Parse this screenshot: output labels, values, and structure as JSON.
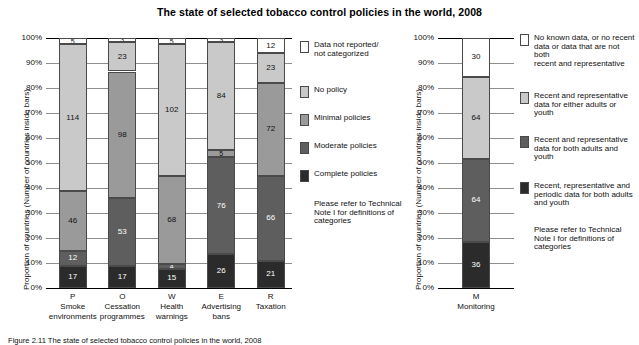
{
  "title": "The state of selected tobacco control policies in the world, 2008",
  "caption": "Figure 2.11 The state of selected tobacco control policies in the world, 2008",
  "colors": {
    "not_reported": "#ffffff",
    "no_policy": "#c9c9c9",
    "minimal": "#9a9a9a",
    "moderate": "#5e5e5e",
    "complete": "#2b2b2b",
    "gridline": "#8e8e8e",
    "axis": "#000000",
    "text": "#111111"
  },
  "left_panel": {
    "y_axis_label": "Proportion of countries (Number of countries inside bars)",
    "tick_labels": [
      "100%",
      "90%",
      "80%",
      "70%",
      "60%",
      "50%",
      "40%",
      "30%",
      "20%",
      "10%",
      "0%"
    ],
    "categories": [
      {
        "letter": "P",
        "name": "Smoke\nenvironments"
      },
      {
        "letter": "O",
        "name": "Cessation\nprogrammes"
      },
      {
        "letter": "W",
        "name": "Health\nwarnings"
      },
      {
        "letter": "E",
        "name": "Advertising\nbans"
      },
      {
        "letter": "R",
        "name": "Taxation"
      }
    ],
    "legend": {
      "items": [
        {
          "key": "not_reported",
          "label": "Data not reported/\nnot categorized"
        },
        {
          "key": "no_policy",
          "label": "No policy"
        },
        {
          "key": "minimal",
          "label": "Minimal policies"
        },
        {
          "key": "moderate",
          "label": "Moderate policies"
        },
        {
          "key": "complete",
          "label": "Complete policies"
        }
      ],
      "note": "Please refer to Technical\nNote I for definitions of\ncategories"
    }
  },
  "right_panel": {
    "y_axis_label": "Proportion of countries (Number of countries inside bars)",
    "tick_labels": [
      "100%",
      "90%",
      "80%",
      "70%",
      "60%",
      "50%",
      "40%",
      "30%",
      "20%",
      "10%",
      "0%"
    ],
    "categories": [
      {
        "letter": "M",
        "name": "Monitoring"
      }
    ],
    "legend": {
      "items": [
        {
          "key": "not_reported",
          "label": "No known data, or no recent\ndata or data that are not both\nrecent and representative"
        },
        {
          "key": "no_policy",
          "label": "Recent and representative\ndata for either adults or youth"
        },
        {
          "key": "moderate",
          "label": "Recent and representative\ndata for both adults and\nyouth"
        },
        {
          "key": "complete",
          "label": "Recent, representative and\nperiodic data for both adults\nand youth"
        }
      ],
      "note": "Please refer to Technical\nNote I for definitions of\ncategories"
    }
  },
  "chart_data": [
    {
      "type": "bar",
      "stacked": true,
      "normalized": true,
      "title": "The state of selected tobacco control policies in the world, 2008",
      "xlabel": "",
      "ylabel": "Proportion of countries (Number of countries inside bars)",
      "ylim": [
        0,
        100
      ],
      "ytick_step": 10,
      "grid": true,
      "legend_position": "right",
      "total_countries": 194,
      "categories": [
        "P Smoke environments",
        "O Cessation programmes",
        "W Health warnings",
        "E Advertising bans",
        "R Taxation"
      ],
      "series": [
        {
          "name": "Complete policies",
          "color": "#2b2b2b",
          "values": [
            17,
            17,
            15,
            26,
            21
          ]
        },
        {
          "name": "Moderate policies",
          "color": "#5e5e5e",
          "values": [
            12,
            53,
            4,
            76,
            66
          ]
        },
        {
          "name": "Minimal policies",
          "color": "#9a9a9a",
          "values": [
            46,
            98,
            68,
            5,
            72
          ]
        },
        {
          "name": "No policy",
          "color": "#c9c9c9",
          "values": [
            114,
            23,
            102,
            84,
            23
          ]
        },
        {
          "name": "Data not reported/not categorized",
          "color": "#ffffff",
          "values": [
            5,
            3,
            5,
            3,
            12
          ]
        }
      ]
    },
    {
      "type": "bar",
      "stacked": true,
      "normalized": true,
      "title": "Monitoring",
      "xlabel": "",
      "ylabel": "Proportion of countries (Number of countries inside bars)",
      "ylim": [
        0,
        100
      ],
      "ytick_step": 10,
      "grid": true,
      "legend_position": "right",
      "total_countries": 194,
      "categories": [
        "M Monitoring"
      ],
      "series": [
        {
          "name": "Recent, representative and periodic data for both adults and youth",
          "color": "#2b2b2b",
          "values": [
            36
          ]
        },
        {
          "name": "Recent and representative data for both adults and youth",
          "color": "#5e5e5e",
          "values": [
            64
          ]
        },
        {
          "name": "Recent and representative data for either adults or youth",
          "color": "#c9c9c9",
          "values": [
            64
          ]
        },
        {
          "name": "No known data, or no recent data or data that are not both recent and representative",
          "color": "#ffffff",
          "values": [
            30
          ]
        }
      ]
    }
  ]
}
